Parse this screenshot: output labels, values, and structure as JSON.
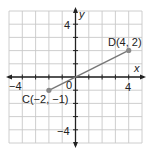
{
  "chart_data": {
    "type": "scatter",
    "title": "",
    "xlabel": "x",
    "ylabel": "y",
    "xlim": [
      -5,
      5
    ],
    "ylim": [
      -5,
      5
    ],
    "grid": true,
    "x_ticks_labeled": [
      "-4",
      "4"
    ],
    "y_ticks_labeled": [
      "4",
      "-4"
    ],
    "origin_label": "0",
    "points": [
      {
        "name": "C",
        "x": -2,
        "y": -1,
        "label": "C(−2, −1)"
      },
      {
        "name": "D",
        "x": 4,
        "y": 2,
        "label": "D(4, 2)"
      }
    ],
    "segments": [
      {
        "from": "C",
        "to": "D"
      }
    ]
  },
  "colors": {
    "grid": "#c8c8c8",
    "axis": "#222222",
    "segment": "#777777",
    "point": "#888888"
  },
  "labels": {
    "x_axis": "x",
    "y_axis": "y",
    "x_neg4": "−4",
    "x_pos4": "4",
    "y_pos4": "4",
    "y_neg4": "−4",
    "origin": "0",
    "point_c": "C(−2, −1)",
    "point_d": "D(4, 2)"
  }
}
